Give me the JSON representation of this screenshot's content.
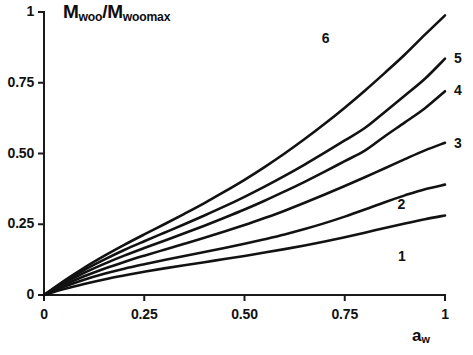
{
  "chart_data": {
    "type": "line",
    "title": "",
    "ylabel": "Mwoo/Mwoomax",
    "ylabel_parts": {
      "m1": "M",
      "sub1": "woo",
      "slash": "/",
      "m2": "M",
      "sub2": "woomax"
    },
    "xlabel": "aw",
    "xlabel_parts": {
      "base": "a",
      "sub": "w"
    },
    "xlim": [
      0,
      1
    ],
    "ylim": [
      0,
      1
    ],
    "grid": false,
    "legend_position": "inline-curve-labels",
    "xticks": [
      0,
      0.25,
      0.5,
      0.75,
      1
    ],
    "xtick_labels": [
      "0",
      "0.25",
      "0.50",
      "0.75",
      "1"
    ],
    "yticks": [
      0,
      0.25,
      0.5,
      0.75,
      1
    ],
    "ytick_labels": [
      "0",
      "0.25",
      "0.50",
      "0.75",
      "1"
    ],
    "x": [
      0,
      0.05,
      0.1,
      0.15,
      0.2,
      0.25,
      0.3,
      0.35,
      0.4,
      0.45,
      0.5,
      0.55,
      0.6,
      0.65,
      0.7,
      0.75,
      0.8,
      0.85,
      0.9,
      0.95,
      1
    ],
    "series": [
      {
        "name": "1",
        "label": "1",
        "label_x": 0.895,
        "label_y": 0.135,
        "values": [
          0,
          0.021,
          0.039,
          0.055,
          0.069,
          0.082,
          0.094,
          0.105,
          0.116,
          0.127,
          0.138,
          0.15,
          0.162,
          0.175,
          0.189,
          0.204,
          0.22,
          0.237,
          0.253,
          0.268,
          0.281
        ]
      },
      {
        "name": "2",
        "label": "2",
        "label_x": 0.894,
        "label_y": 0.317,
        "values": [
          0,
          0.029,
          0.054,
          0.075,
          0.093,
          0.109,
          0.124,
          0.138,
          0.152,
          0.166,
          0.181,
          0.197,
          0.214,
          0.233,
          0.254,
          0.277,
          0.302,
          0.328,
          0.352,
          0.374,
          0.39
        ]
      },
      {
        "name": "3",
        "label": "3",
        "label_x": 1.035,
        "label_y": 0.535,
        "values": [
          0,
          0.035,
          0.066,
          0.093,
          0.117,
          0.139,
          0.16,
          0.181,
          0.202,
          0.224,
          0.247,
          0.272,
          0.298,
          0.326,
          0.355,
          0.385,
          0.416,
          0.448,
          0.48,
          0.511,
          0.538
        ]
      },
      {
        "name": "4",
        "label": "4",
        "label_x": 1.035,
        "label_y": 0.72,
        "values": [
          0,
          0.041,
          0.078,
          0.11,
          0.139,
          0.166,
          0.192,
          0.218,
          0.245,
          0.273,
          0.302,
          0.333,
          0.366,
          0.4,
          0.436,
          0.473,
          0.51,
          0.561,
          0.61,
          0.66,
          0.72
        ]
      },
      {
        "name": "5",
        "label": "5",
        "label_x": 1.035,
        "label_y": 0.835,
        "values": [
          0,
          0.046,
          0.088,
          0.125,
          0.159,
          0.19,
          0.22,
          0.25,
          0.281,
          0.313,
          0.347,
          0.383,
          0.421,
          0.461,
          0.503,
          0.546,
          0.59,
          0.647,
          0.705,
          0.764,
          0.835
        ]
      },
      {
        "name": "6",
        "label": "6",
        "label_x": 0.705,
        "label_y": 0.905,
        "values": [
          0,
          0.05,
          0.096,
          0.138,
          0.177,
          0.214,
          0.25,
          0.287,
          0.325,
          0.365,
          0.407,
          0.452,
          0.5,
          0.551,
          0.605,
          0.662,
          0.722,
          0.785,
          0.85,
          0.92,
          0.988
        ]
      }
    ]
  }
}
